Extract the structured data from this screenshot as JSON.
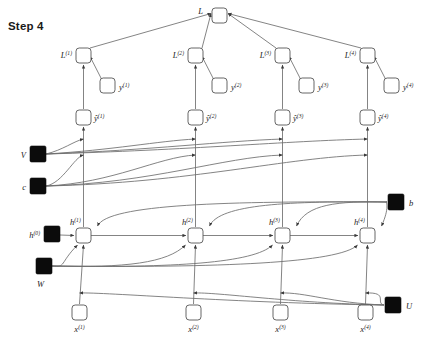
{
  "diagram": {
    "title": "Step 4",
    "type": "unfolded-rnn-computational-graph",
    "timesteps": 4,
    "canvas": {
      "width": 423,
      "height": 349
    },
    "node_size": 15,
    "param_size": 16,
    "rows": {
      "L_total_y": 8,
      "L_t_y": 48,
      "y_target_y": 78,
      "o_hat_y": 110,
      "V_y": 146,
      "c_y": 178,
      "b_y": 194,
      "h_y": 228,
      "h0_y": 226,
      "W_y": 258,
      "U_y": 297,
      "x_y": 305
    },
    "columns_x": [
      76,
      188,
      275,
      360
    ],
    "x_columns_x": [
      72,
      186,
      273,
      358
    ],
    "nodes": {
      "loss_total": {
        "label": "L",
        "sup": "",
        "x": 212,
        "y": 8,
        "kind": "open"
      },
      "loss_steps": [
        {
          "label": "L",
          "sup": "(1)",
          "x": 76,
          "y": 48,
          "kind": "open",
          "label_side": "left"
        },
        {
          "label": "L",
          "sup": "(2)",
          "x": 188,
          "y": 48,
          "kind": "open",
          "label_side": "left"
        },
        {
          "label": "L",
          "sup": "(3)",
          "x": 275,
          "y": 48,
          "kind": "open",
          "label_side": "left"
        },
        {
          "label": "L",
          "sup": "(4)",
          "x": 360,
          "y": 48,
          "kind": "open",
          "label_side": "left"
        }
      ],
      "targets": [
        {
          "label": "y",
          "sup": "(1)",
          "x": 100,
          "y": 78,
          "kind": "open",
          "label_side": "right"
        },
        {
          "label": "y",
          "sup": "(2)",
          "x": 212,
          "y": 78,
          "kind": "open",
          "label_side": "right"
        },
        {
          "label": "y",
          "sup": "(3)",
          "x": 299,
          "y": 78,
          "kind": "open",
          "label_side": "right"
        },
        {
          "label": "y",
          "sup": "(4)",
          "x": 384,
          "y": 78,
          "kind": "open",
          "label_side": "right"
        }
      ],
      "outputs": [
        {
          "label": "ŷ",
          "sup": "(1)",
          "x": 76,
          "y": 110,
          "kind": "open",
          "label_side": "right"
        },
        {
          "label": "ŷ",
          "sup": "(2)",
          "x": 188,
          "y": 110,
          "kind": "open",
          "label_side": "right"
        },
        {
          "label": "ŷ",
          "sup": "(3)",
          "x": 275,
          "y": 110,
          "kind": "open",
          "label_side": "right"
        },
        {
          "label": "ŷ",
          "sup": "(4)",
          "x": 360,
          "y": 110,
          "kind": "open",
          "label_side": "right"
        }
      ],
      "hidden": [
        {
          "label": "h",
          "sup": "(1)",
          "x": 76,
          "y": 228,
          "kind": "open",
          "label_side": "above"
        },
        {
          "label": "h",
          "sup": "(2)",
          "x": 188,
          "y": 228,
          "kind": "open",
          "label_side": "above"
        },
        {
          "label": "h",
          "sup": "(3)",
          "x": 275,
          "y": 228,
          "kind": "open",
          "label_side": "above"
        },
        {
          "label": "h",
          "sup": "(4)",
          "x": 360,
          "y": 228,
          "kind": "open",
          "label_side": "above"
        }
      ],
      "inputs": [
        {
          "label": "x",
          "sup": "(1)",
          "x": 72,
          "y": 305,
          "kind": "open",
          "label_side": "below"
        },
        {
          "label": "x",
          "sup": "(2)",
          "x": 186,
          "y": 305,
          "kind": "open",
          "label_side": "below"
        },
        {
          "label": "x",
          "sup": "(3)",
          "x": 273,
          "y": 305,
          "kind": "open",
          "label_side": "below"
        },
        {
          "label": "x",
          "sup": "(4)",
          "x": 358,
          "y": 305,
          "kind": "open",
          "label_side": "below"
        }
      ],
      "params": [
        {
          "name": "V",
          "label": "V",
          "sup": "",
          "x": 30,
          "y": 146,
          "label_side": "left"
        },
        {
          "name": "c",
          "label": "c",
          "sup": "",
          "x": 30,
          "y": 178,
          "label_side": "left"
        },
        {
          "name": "h0",
          "label": "h",
          "sup": "(0)",
          "x": 44,
          "y": 226,
          "label_side": "left"
        },
        {
          "name": "W",
          "label": "W",
          "sup": "",
          "x": 36,
          "y": 258,
          "label_side": "below"
        },
        {
          "name": "b",
          "label": "b",
          "sup": "",
          "x": 388,
          "y": 194,
          "label_side": "right"
        },
        {
          "name": "U",
          "label": "U",
          "sup": "",
          "x": 385,
          "y": 297,
          "label_side": "right"
        }
      ]
    },
    "colors": {
      "background": "#ffffff",
      "node_fill": "#ffffff",
      "node_stroke": "#555555",
      "param_fill": "#0b0b0b",
      "edge": "#6e6e6e",
      "text": "#222222",
      "title": "#1a1a1a"
    }
  }
}
